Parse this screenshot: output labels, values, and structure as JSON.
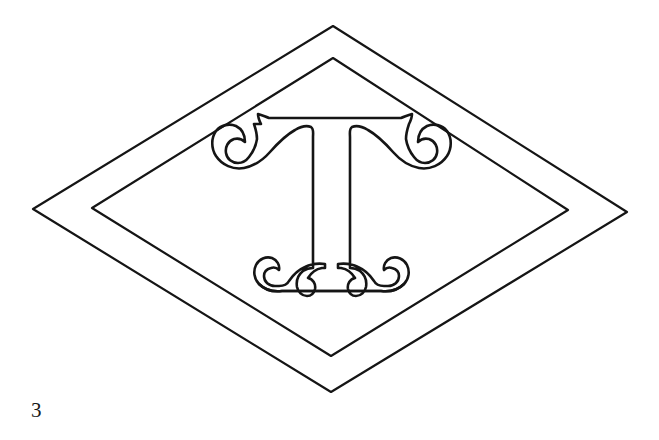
{
  "page": {
    "background_color": "#ffffff",
    "ink_color": "#151515",
    "width": 659,
    "height": 440,
    "kind": "line-art-figure"
  },
  "figure": {
    "stroke_color": "#151515",
    "fill_color": "none",
    "elements": [
      {
        "name": "outer-diamond",
        "shape": "lozenge",
        "stroke_width": 2.2,
        "vertices": {
          "top": [
            333,
            26
          ],
          "right": [
            627,
            212
          ],
          "bottom": [
            331,
            392
          ],
          "left": [
            33,
            209
          ]
        }
      },
      {
        "name": "inner-diamond",
        "shape": "lozenge",
        "stroke_width": 2.2,
        "vertices": {
          "top": [
            333,
            58
          ],
          "right": [
            568,
            210
          ],
          "bottom": [
            331,
            356
          ],
          "left": [
            92,
            208
          ]
        }
      },
      {
        "name": "letter-t-monogram",
        "shape": "ornate-serif-letter",
        "letter": "T",
        "stroke_width": 2.6,
        "crossbar": {
          "left_x": 258,
          "right_x": 412,
          "y": 118
        },
        "stem": {
          "left_x": 317,
          "right_x": 351,
          "top_y": 128,
          "bottom_y": 275
        },
        "base": {
          "left_x": 265,
          "right_x": 400,
          "top_y": 262,
          "bottom_y": 302
        },
        "left_scroll_curl_center": [
          240,
          160
        ],
        "right_scroll_curl_center": [
          428,
          158
        ]
      }
    ]
  },
  "caption": {
    "label": "3"
  }
}
